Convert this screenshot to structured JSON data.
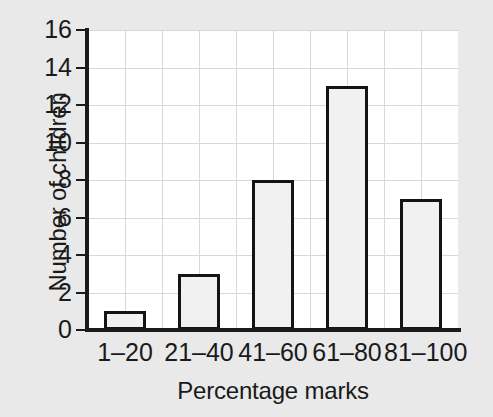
{
  "chart_data": {
    "type": "bar",
    "title": "",
    "title_fragment_visible": true,
    "xlabel": "Percentage marks",
    "ylabel": "Number of children",
    "categories": [
      "1–20",
      "21–40",
      "41–60",
      "61–80",
      "81–100"
    ],
    "values": [
      1,
      3,
      8,
      13,
      7
    ],
    "ylim": [
      0,
      16
    ],
    "ytick_labels": [
      "0",
      "2",
      "4",
      "6",
      "8",
      "10",
      "12",
      "14",
      "16"
    ],
    "ytick_values": [
      0,
      2,
      4,
      6,
      8,
      10,
      12,
      14,
      16
    ],
    "grid": true,
    "grid_axis": "both",
    "legend": "none",
    "colors": {
      "page_background": "#e9e9e9",
      "plot_background": "#ffffff",
      "bar_fill": "#f1f1f1",
      "bar_border": "#141414",
      "axis": "#1a1a1a",
      "gridline": "#d8d8d8",
      "text": "#1a1a1a"
    }
  }
}
